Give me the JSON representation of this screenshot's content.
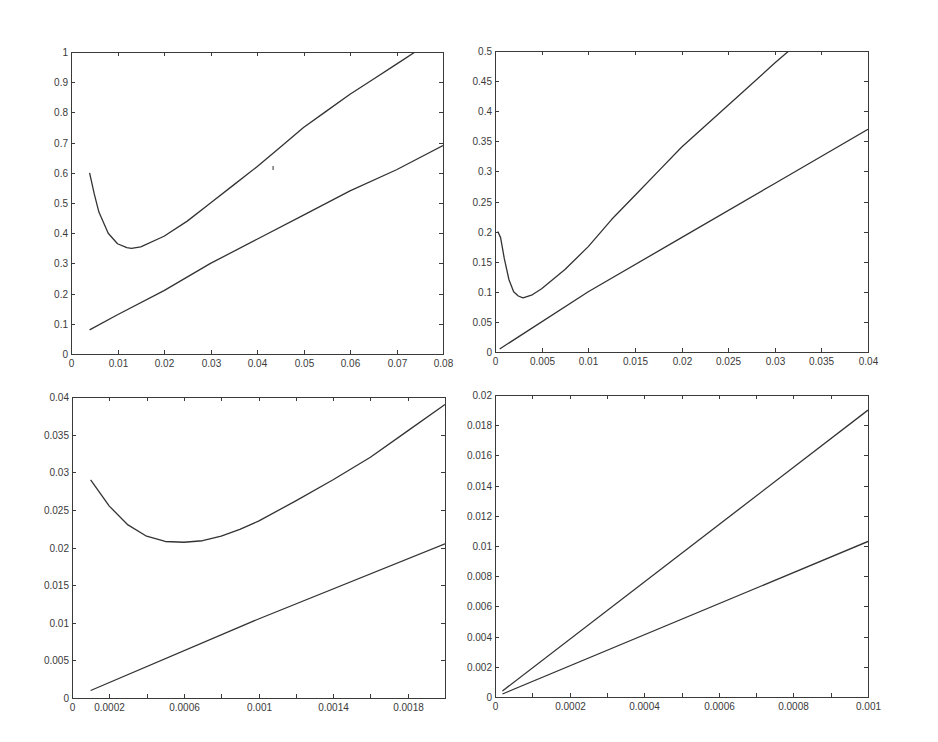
{
  "figure": {
    "background": "#ffffff",
    "line_color": "#333333",
    "axis_color": "#3a3a3a"
  },
  "chart_data": [
    {
      "id": "top-left",
      "type": "line",
      "title": "",
      "xlabel": "",
      "ylabel": "",
      "xlim": [
        0,
        0.08
      ],
      "ylim": [
        0,
        1
      ],
      "grid": false,
      "legend": null,
      "xticks": [
        0,
        0.01,
        0.02,
        0.03,
        0.04,
        0.05,
        0.06,
        0.07,
        0.08
      ],
      "xtick_labels": [
        "0",
        "0.01",
        "0.02",
        "0.03",
        "0.04",
        "0.05",
        "0.06",
        "0.07",
        "0.08"
      ],
      "yticks": [
        0,
        0.1,
        0.2,
        0.3,
        0.4,
        0.5,
        0.6,
        0.7,
        0.8,
        0.9,
        1
      ],
      "ytick_labels": [
        "0",
        "0.1",
        "0.2",
        "0.3",
        "0.4",
        "0.5",
        "0.6",
        "0.7",
        "0.8",
        "0.9",
        "1"
      ],
      "series": [
        {
          "name": "upper curve",
          "x": [
            0.004,
            0.005,
            0.006,
            0.008,
            0.01,
            0.012,
            0.013,
            0.015,
            0.02,
            0.025,
            0.03,
            0.035,
            0.04,
            0.045,
            0.05,
            0.055,
            0.06,
            0.065,
            0.07,
            0.074
          ],
          "y": [
            0.6,
            0.53,
            0.47,
            0.4,
            0.365,
            0.352,
            0.35,
            0.355,
            0.39,
            0.44,
            0.5,
            0.56,
            0.62,
            0.685,
            0.75,
            0.805,
            0.86,
            0.91,
            0.96,
            1.0
          ]
        },
        {
          "name": "lower line",
          "x": [
            0.004,
            0.01,
            0.02,
            0.03,
            0.04,
            0.05,
            0.06,
            0.07,
            0.08
          ],
          "y": [
            0.08,
            0.13,
            0.21,
            0.3,
            0.38,
            0.46,
            0.54,
            0.61,
            0.69
          ]
        }
      ]
    },
    {
      "id": "top-right",
      "type": "line",
      "title": "",
      "xlabel": "",
      "ylabel": "",
      "xlim": [
        0,
        0.04
      ],
      "ylim": [
        0,
        0.5
      ],
      "grid": false,
      "legend": null,
      "xticks": [
        0,
        0.005,
        0.01,
        0.015,
        0.02,
        0.025,
        0.03,
        0.035,
        0.04
      ],
      "xtick_labels": [
        "0",
        "0.005",
        "0.01",
        "0.015",
        "0.02",
        "0.025",
        "0.03",
        "0.035",
        "0.04"
      ],
      "yticks": [
        0,
        0.05,
        0.1,
        0.15,
        0.2,
        0.25,
        0.3,
        0.35,
        0.4,
        0.45,
        0.5
      ],
      "ytick_labels": [
        "0",
        "0.05",
        "0.1",
        "0.15",
        "0.2",
        "0.25",
        "0.3",
        "0.35",
        "0.4",
        "0.45",
        "0.5"
      ],
      "series": [
        {
          "name": "upper curve",
          "x": [
            0.0003,
            0.0006,
            0.001,
            0.0015,
            0.002,
            0.0025,
            0.003,
            0.004,
            0.005,
            0.0075,
            0.01,
            0.0125,
            0.015,
            0.0175,
            0.02,
            0.025,
            0.03,
            0.0315
          ],
          "y": [
            0.2,
            0.19,
            0.155,
            0.12,
            0.1,
            0.093,
            0.09,
            0.095,
            0.105,
            0.137,
            0.175,
            0.22,
            0.26,
            0.3,
            0.34,
            0.41,
            0.48,
            0.5
          ]
        },
        {
          "name": "lower line",
          "x": [
            0.0005,
            0.01,
            0.02,
            0.03,
            0.04
          ],
          "y": [
            0.005,
            0.1,
            0.19,
            0.28,
            0.37
          ]
        }
      ]
    },
    {
      "id": "bottom-left",
      "type": "line",
      "title": "",
      "xlabel": "",
      "ylabel": "",
      "xlim": [
        0,
        0.002
      ],
      "ylim": [
        0,
        0.04
      ],
      "grid": false,
      "legend": null,
      "xticks": [
        0,
        0.0002,
        0.0004,
        0.0006,
        0.0008,
        0.001,
        0.0012,
        0.0014,
        0.0016,
        0.0018,
        0.002
      ],
      "xtick_labels": [
        "0",
        "0.0002",
        "",
        "0.0006",
        "",
        "0.001",
        "",
        "0.0014",
        "",
        "0.0018",
        ""
      ],
      "yticks": [
        0,
        0.005,
        0.01,
        0.015,
        0.02,
        0.025,
        0.03,
        0.035,
        0.04
      ],
      "ytick_labels": [
        "0",
        "0.005",
        "0.01",
        "0.015",
        "0.02",
        "0.025",
        "0.03",
        "0.035",
        "0.04"
      ],
      "series": [
        {
          "name": "upper curve",
          "x": [
            0.0001,
            0.0002,
            0.0003,
            0.0004,
            0.0005,
            0.0006,
            0.0007,
            0.0008,
            0.0009,
            0.001,
            0.0012,
            0.0014,
            0.0016,
            0.0018,
            0.002
          ],
          "y": [
            0.029,
            0.0255,
            0.023,
            0.0215,
            0.0208,
            0.0207,
            0.0209,
            0.0215,
            0.0224,
            0.0235,
            0.0262,
            0.029,
            0.032,
            0.0355,
            0.039
          ]
        },
        {
          "name": "lower line",
          "x": [
            0.0001,
            0.001,
            0.002
          ],
          "y": [
            0.001,
            0.0105,
            0.0205
          ]
        }
      ]
    },
    {
      "id": "bottom-right",
      "type": "line",
      "title": "",
      "xlabel": "",
      "ylabel": "",
      "xlim": [
        0,
        0.001
      ],
      "ylim": [
        0,
        0.02
      ],
      "grid": false,
      "legend": null,
      "xticks": [
        0,
        0.0001,
        0.0002,
        0.0003,
        0.0004,
        0.0005,
        0.0006,
        0.0007,
        0.0008,
        0.0009,
        0.001
      ],
      "xtick_labels": [
        "0",
        "",
        "0.0002",
        "",
        "0.0004",
        "",
        "0.0006",
        "",
        "0.0008",
        "",
        "0.001"
      ],
      "yticks": [
        0,
        0.002,
        0.004,
        0.006,
        0.008,
        0.01,
        0.012,
        0.014,
        0.016,
        0.018,
        0.02
      ],
      "ytick_labels": [
        "0",
        "0.002",
        "0.004",
        "0.006",
        "0.008",
        "0.01",
        "0.012",
        "0.014",
        "0.016",
        "0.018",
        "0.02"
      ],
      "series": [
        {
          "name": "upper line",
          "x": [
            2e-05,
            0.001
          ],
          "y": [
            0.0004,
            0.019
          ]
        },
        {
          "name": "lower line",
          "x": [
            2e-05,
            0.001
          ],
          "y": [
            0.0002,
            0.0103
          ]
        }
      ]
    }
  ]
}
